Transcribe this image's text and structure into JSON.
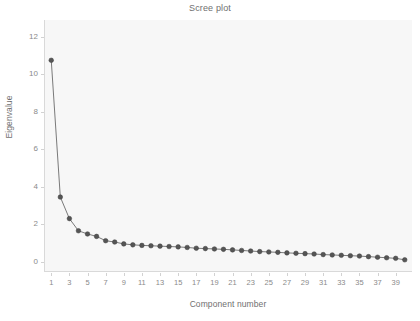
{
  "chart_data": {
    "type": "line",
    "title": "Scree plot",
    "xlabel": "Component number",
    "ylabel": "Eigenvalue",
    "xlim": [
      0.2,
      40.8
    ],
    "ylim": [
      -0.55,
      12.9
    ],
    "grid": false,
    "legend": null,
    "marker": "circle",
    "series_color": "#555555",
    "line_color": "#6b6b6b",
    "plot_background": "#f7f7f7",
    "figure_background": "#ffffff",
    "x": [
      1,
      2,
      3,
      4,
      5,
      6,
      7,
      8,
      9,
      10,
      11,
      12,
      13,
      14,
      15,
      16,
      17,
      18,
      19,
      20,
      21,
      22,
      23,
      24,
      25,
      26,
      27,
      28,
      29,
      30,
      31,
      32,
      33,
      34,
      35,
      36,
      37,
      38,
      39,
      40
    ],
    "values": [
      10.75,
      3.45,
      2.3,
      1.65,
      1.48,
      1.35,
      1.12,
      1.05,
      0.95,
      0.9,
      0.87,
      0.85,
      0.83,
      0.81,
      0.79,
      0.76,
      0.72,
      0.7,
      0.68,
      0.66,
      0.63,
      0.6,
      0.57,
      0.54,
      0.52,
      0.5,
      0.47,
      0.45,
      0.43,
      0.41,
      0.38,
      0.36,
      0.34,
      0.32,
      0.3,
      0.27,
      0.24,
      0.21,
      0.18,
      0.1
    ],
    "ytick_labels": [
      "0",
      "2",
      "4",
      "6",
      "8",
      "10",
      "12"
    ],
    "ytick_values": [
      0,
      2,
      4,
      6,
      8,
      10,
      12
    ],
    "xtick_labels": [
      "1",
      "3",
      "5",
      "7",
      "9",
      "11",
      "13",
      "15",
      "17",
      "19",
      "21",
      "23",
      "25",
      "27",
      "29",
      "31",
      "33",
      "35",
      "37",
      "39"
    ],
    "xtick_values": [
      1,
      3,
      5,
      7,
      9,
      11,
      13,
      15,
      17,
      19,
      21,
      23,
      25,
      27,
      29,
      31,
      33,
      35,
      37,
      39
    ]
  }
}
